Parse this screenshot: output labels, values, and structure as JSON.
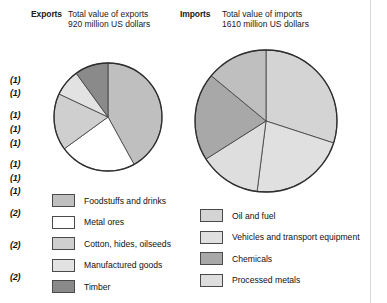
{
  "headers": {
    "exports_label": "Exports",
    "exports_line1": "Total value of exports",
    "exports_line2": "920 million US dollars",
    "imports_label": "Imports",
    "imports_line1": "Total value of imports",
    "imports_line2": "1610 million US dollars"
  },
  "markers": [
    {
      "text": "(1)",
      "top": 75
    },
    {
      "text": "(1)",
      "top": 88
    },
    {
      "text": "(1)",
      "top": 110
    },
    {
      "text": "(1)",
      "top": 124
    },
    {
      "text": "(1)",
      "top": 138
    },
    {
      "text": "(1)",
      "top": 159
    },
    {
      "text": "(1)",
      "top": 173
    },
    {
      "text": "(1)",
      "top": 186
    },
    {
      "text": "(2)",
      "top": 208
    },
    {
      "text": "(2)",
      "top": 240
    },
    {
      "text": "(2)",
      "top": 272
    }
  ],
  "colors": {
    "foodstuffs": "#bfbfbf",
    "metal_ores": "#ffffff",
    "cotton": "#cfcfcf",
    "manufactured": "#e2e2e2",
    "timber": "#8a8a8a",
    "oil_fuel": "#d4d4d4",
    "vehicles": "#e0e0e0",
    "chemicals": "#a8a8a8",
    "processed": "#dedede",
    "outline": "#3c3c3c",
    "frame": "#d9d9d9"
  },
  "legend_left": [
    {
      "label": "Foodstuffs and drinks",
      "color": "#bfbfbf",
      "key": "foodstuffs"
    },
    {
      "label": "Metal ores",
      "color": "#ffffff",
      "key": "metal-ores"
    },
    {
      "label": "Cotton, hides, oilseeds",
      "color": "#cfcfcf",
      "key": "cotton-hides-oilseeds"
    },
    {
      "label": "Manufactured goods",
      "color": "#e2e2e2",
      "key": "manufactured-goods"
    },
    {
      "label": "Timber",
      "color": "#8a8a8a",
      "key": "timber"
    }
  ],
  "legend_right": [
    {
      "label": "Oil and fuel",
      "color": "#d4d4d4",
      "key": "oil-and-fuel"
    },
    {
      "label": "Vehicles and transport equipment",
      "color": "#e0e0e0",
      "key": "vehicles-transport"
    },
    {
      "label": "Chemicals",
      "color": "#a8a8a8",
      "key": "chemicals"
    },
    {
      "label": "Processed metals",
      "color": "#dedede",
      "key": "processed-metals"
    }
  ],
  "chart_data": [
    {
      "type": "pie",
      "title": "Total value of exports 920 million US dollars",
      "name": "exports",
      "total": 920,
      "unit": "million US dollars",
      "center": [
        108,
        117
      ],
      "radius": 54,
      "start_angle": -90,
      "direction": "clockwise",
      "categories": [
        "Foodstuffs and drinks",
        "Metal ores",
        "Cotton, hides, oilseeds",
        "Manufactured goods",
        "Timber"
      ],
      "values": [
        42,
        23,
        17,
        8,
        10
      ],
      "unit_values": "percent",
      "slices": [
        {
          "label": "Foodstuffs and drinks",
          "percent": 42,
          "color": "#bfbfbf"
        },
        {
          "label": "Metal ores",
          "percent": 23,
          "color": "#ffffff"
        },
        {
          "label": "Cotton, hides, oilseeds",
          "percent": 17,
          "color": "#cfcfcf"
        },
        {
          "label": "Manufactured goods",
          "percent": 8,
          "color": "#e2e2e2"
        },
        {
          "label": "Timber",
          "percent": 10,
          "color": "#8a8a8a"
        }
      ]
    },
    {
      "type": "pie",
      "title": "Total value of imports 1610 million US dollars",
      "name": "imports",
      "total": 1610,
      "unit": "million US dollars",
      "center": [
        266,
        121
      ],
      "radius": 71,
      "start_angle": -90,
      "direction": "clockwise",
      "categories": [
        "Oil and fuel",
        "Vehicles and transport equipment",
        "Processed metals",
        "Chemicals",
        "Foodstuffs and drinks"
      ],
      "values": [
        30,
        22,
        14,
        20,
        14
      ],
      "unit_values": "percent",
      "slices": [
        {
          "label": "Oil and fuel",
          "percent": 30,
          "color": "#d4d4d4"
        },
        {
          "label": "Vehicles and transport equipment",
          "percent": 22,
          "color": "#e0e0e0"
        },
        {
          "label": "Processed metals",
          "percent": 14,
          "color": "#dedede"
        },
        {
          "label": "Chemicals",
          "percent": 20,
          "color": "#a8a8a8"
        },
        {
          "label": "Foodstuffs and drinks",
          "percent": 14,
          "color": "#bfbfbf"
        }
      ]
    }
  ]
}
